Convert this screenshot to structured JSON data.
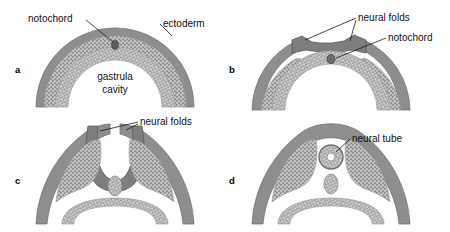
{
  "figure": {
    "background_color": "#ffffff",
    "colors": {
      "ectoderm_band": "#8a8a8a",
      "ectoderm_outline": "#5f5f5f",
      "mesoderm_stipple": "#9a9a9a",
      "endoderm_stipple": "#9a9a9a",
      "notochord": "#6d6d6d",
      "neural_fold": "#7e7e7e",
      "label_text": "#111111",
      "leader_line": "#1a1a1a"
    }
  },
  "panels": [
    {
      "letter": "a",
      "letter_x": 15,
      "letter_y": 73,
      "labels": [
        {
          "id": "notochord-a",
          "text": "notochord",
          "x": 28,
          "y": 22
        },
        {
          "id": "ectoderm-a",
          "text": "ectoderm",
          "x": 163,
          "y": 27
        },
        {
          "id": "gastrula-cavity-line1",
          "text": "gastrula",
          "x": 115,
          "y": 80
        },
        {
          "id": "gastrula-cavity-line2",
          "text": "cavity",
          "x": 115,
          "y": 93
        }
      ]
    },
    {
      "letter": "b",
      "letter_x": 229,
      "letter_y": 73,
      "labels": [
        {
          "id": "neural-folds-b",
          "text": "neural folds",
          "x": 358,
          "y": 21
        },
        {
          "id": "notochord-b",
          "text": "notochord",
          "x": 388,
          "y": 41
        }
      ]
    },
    {
      "letter": "c",
      "letter_x": 15,
      "letter_y": 184,
      "labels": [
        {
          "id": "neural-folds-c",
          "text": "neural folds",
          "x": 140,
          "y": 125
        }
      ]
    },
    {
      "letter": "d",
      "letter_x": 229,
      "letter_y": 184,
      "labels": [
        {
          "id": "neural-tube-d",
          "text": "neural tube",
          "x": 352,
          "y": 142
        }
      ]
    }
  ],
  "structures": {
    "notochord": "notochord",
    "ectoderm": "ectoderm",
    "gastrula_cavity": "gastrula cavity",
    "neural_folds": "neural folds",
    "neural_tube": "neural tube"
  }
}
